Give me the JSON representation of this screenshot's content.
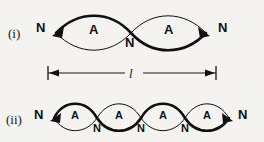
{
  "figure": {
    "background_color": "#f4f3f0",
    "ink_color": "#101014"
  },
  "rows": [
    {
      "id": "row-i",
      "roman_label": "(i)",
      "loops": 2,
      "end_node_left": "N",
      "end_node_right": "N",
      "antinode_labels": [
        "A",
        "A"
      ],
      "interior_node_labels": [
        "N"
      ]
    },
    {
      "id": "row-ii",
      "roman_label": "(ii)",
      "loops": 4,
      "end_node_left": "N",
      "end_node_right": "N",
      "antinode_labels": [
        "A",
        "A",
        "A",
        "A"
      ],
      "interior_node_labels": [
        "N",
        "N",
        "N"
      ]
    }
  ],
  "dimension": {
    "label": "l",
    "arrow_left": "◄",
    "arrow_right": "►"
  }
}
